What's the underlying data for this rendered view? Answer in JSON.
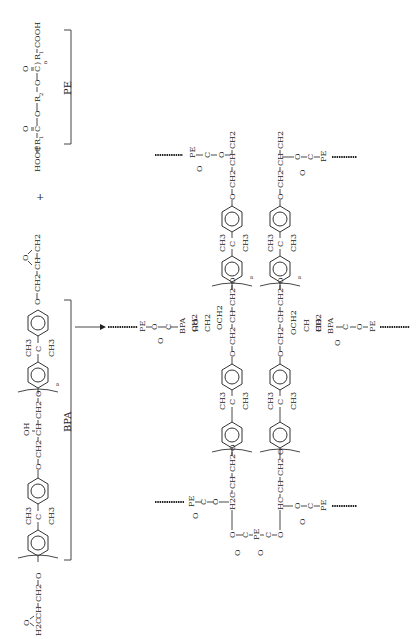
{
  "figure": {
    "orientation": "rotated 90 degrees (text reads bottom-to-top)",
    "reactants": {
      "epoxy": {
        "label": "BPA",
        "end_group_left": "H2C–CH–CH2–O (epoxide)",
        "repeat_unit": [
          "O",
          "CH2",
          "CH",
          "OH",
          "CH2",
          "O"
        ],
        "bisphenol_center": {
          "c": "C",
          "me1": "CH3",
          "me2": "CH3"
        },
        "repeat_subscript": "n",
        "end_group_right": "O–CH2–CH–CH2 (epoxide)",
        "texts": {
          "ch2_a": "CH2",
          "ch_a": "CH",
          "o_epox_a": "O",
          "h2c_a": "H2C",
          "o1": "O",
          "ch2_1": "CH2",
          "ch_1": "CH",
          "ch2_2": "CH2",
          "oh": "OH",
          "o2": "O",
          "ch3_1": "CH3",
          "c_1": "C",
          "ch3_2": "CH3",
          "ch3_3": "CH3",
          "c_2": "C",
          "ch3_4": "CH3",
          "o3": "O",
          "ch2_3": "CH2",
          "ch_b": "CH",
          "ch2_b": "CH2",
          "o_epox_b": "O",
          "n": "n"
        }
      },
      "plus": "+",
      "polyester": {
        "label": "PE",
        "formula": "HOOC–(R1–C(=O)–O–R2–O–C(=O))n–R1–COOH",
        "texts": {
          "hooc": "HOOC",
          "r1": "R",
          "r1_sub": "1",
          "c1": "C",
          "o_dbl1": "O",
          "o1": "O",
          "r2": "R",
          "r2_sub": "2",
          "o2": "O",
          "c2": "C",
          "o_dbl2": "O",
          "n": "n",
          "r3": "R",
          "r3_sub": "1",
          "cooh": "COOH"
        }
      }
    },
    "arrow": "→",
    "product": {
      "description": "Crosslinked network of BPA epoxy chains joined through PE ester linkages",
      "texts": {
        "pe": "PE",
        "c": "C",
        "o": "O",
        "ch": "CH",
        "ch2": "CH2",
        "hc": "HC",
        "h2c": "H2C",
        "ho": "HO",
        "bpa": "BPA",
        "ch3": "CH3",
        "n": "n",
        "och2": "OCH2"
      }
    }
  }
}
